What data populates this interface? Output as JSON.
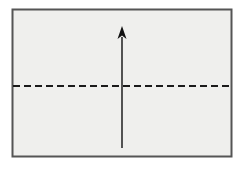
{
  "figure": {
    "background_color": "#ffffff",
    "canvas": {
      "width": 245,
      "height": 174
    }
  },
  "rectangle": {
    "name": "plate-outline",
    "label": "",
    "x": 12.5,
    "y": 9.5,
    "width": 219,
    "height": 147,
    "fill_color": "#efefed",
    "stroke_color": "#555555",
    "stroke_width": 2
  },
  "dashed_line": {
    "name": "horizontal-dashed-midline",
    "label": "",
    "x1": 13,
    "x2": 231,
    "y": 86,
    "stroke_color": "#1a1a1a",
    "stroke_width": 2,
    "dash_length": 7,
    "gap_length": 4
  },
  "arrow": {
    "name": "upward-vertical-arrow",
    "label": "",
    "x": 122,
    "tail_y": 148,
    "tip_y": 26,
    "stroke_color": "#111111",
    "stroke_width": 1.4,
    "head_width": 9,
    "head_length": 13,
    "direction": "up"
  },
  "annotations": []
}
